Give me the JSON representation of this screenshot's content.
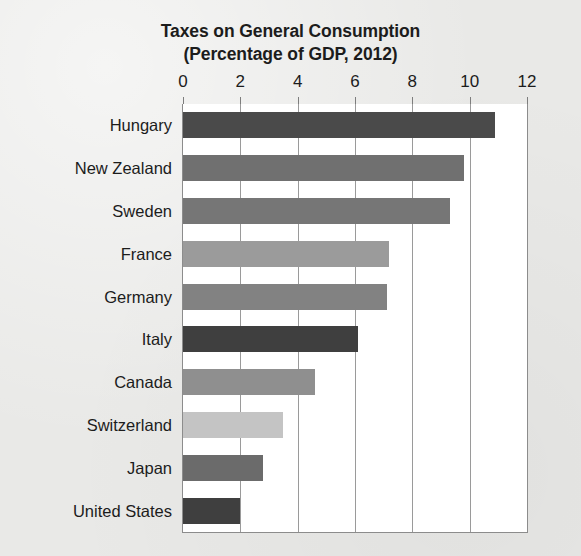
{
  "chart_data": {
    "type": "bar",
    "orientation": "horizontal",
    "title": "Taxes on General Consumption",
    "subtitle": "(Percentage of GDP, 2012)",
    "xlabel": "",
    "ylabel": "",
    "xlim": [
      0,
      12
    ],
    "xticks": [
      0,
      2,
      4,
      6,
      8,
      10,
      12
    ],
    "xtick_labels": [
      "0",
      "2",
      "4",
      "6",
      "8",
      "10",
      "12"
    ],
    "grid": "vertical",
    "legend": "none",
    "categories": [
      "Hungary",
      "New Zealand",
      "Sweden",
      "France",
      "Germany",
      "Italy",
      "Canada",
      "Switzerland",
      "Japan",
      "United States"
    ],
    "values": [
      10.9,
      9.8,
      9.3,
      7.2,
      7.1,
      6.1,
      4.6,
      3.5,
      2.8,
      2.0
    ],
    "bar_colors": [
      "#4a4a4a",
      "#707070",
      "#767676",
      "#9b9b9b",
      "#828282",
      "#3f3f3f",
      "#8f8f8f",
      "#c4c4c4",
      "#6b6b6b",
      "#3f3f3f"
    ],
    "colors": {
      "background": "#e9e9e7",
      "plot_background": "#ffffff",
      "gridline": "#9a9a9a",
      "axis_line": "#8c8c8c",
      "text": "#1c1c1c"
    }
  }
}
